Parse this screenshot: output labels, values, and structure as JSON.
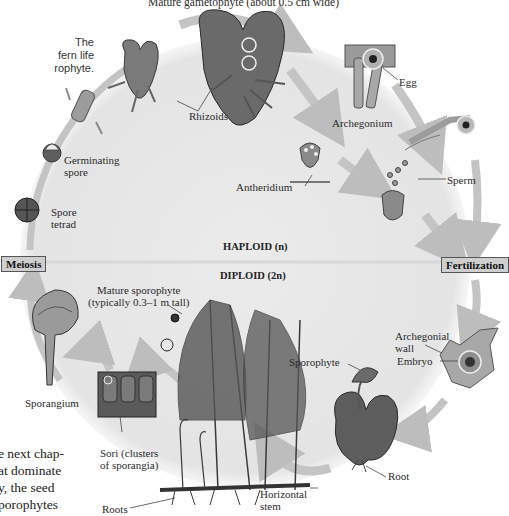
{
  "figure": {
    "title_partial": "Mature gametophyte (about 0.5 cm wide)",
    "side_caption_lines": [
      "The",
      "fern life",
      "rophyte."
    ],
    "body_text_lines": [
      "e next chap-",
      "at dominate",
      "y, the seed",
      "porophytes"
    ],
    "phases": {
      "haploid": "HAPLOID (n)",
      "diploid": "DIPLOID (2n)"
    },
    "process_boxes": {
      "meiosis": "Meiosis",
      "fertilization": "Fertilization"
    },
    "labels": {
      "rhizoids": "Rhizoids",
      "egg": "Egg",
      "archegonium": "Archegonium",
      "antheridium": "Antheridium",
      "sperm": "Sperm",
      "germinating_spore_1": "Germinating",
      "germinating_spore_2": "spore",
      "spore_tetrad_1": "Spore",
      "spore_tetrad_2": "tetrad",
      "mature_sporophyte_1": "Mature sporophyte",
      "mature_sporophyte_2": "(typically 0.3–1 m tall)",
      "sporangium": "Sporangium",
      "sori_1": "Sori (clusters",
      "sori_2": "of sporangia)",
      "roots": "Roots",
      "horizontal_stem_1": "Horizontal",
      "horizontal_stem_2": "stem",
      "archegonial_wall_1": "Archegonial",
      "archegonial_wall_2": "wall",
      "embryo": "Embryo",
      "sporophyte": "Sporophyte",
      "root": "Root"
    },
    "colors": {
      "haploid_bg": "#ececec",
      "diploid_bg": "#e6e6e6",
      "arrow": "#bdbdbd",
      "box_fill": "#cfcfcf",
      "gametophyte": "#6f6f6f",
      "tissue": "#a8a8a8"
    }
  }
}
